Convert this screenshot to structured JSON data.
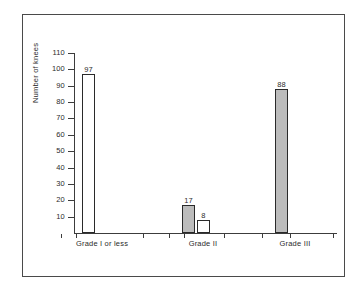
{
  "chart_data": {
    "type": "bar",
    "title": "",
    "subtitle": "",
    "xlabel": "",
    "ylabel": "Number of knees",
    "categories": [
      "Grade I or less",
      "Grade II",
      "Grade III"
    ],
    "ylim": [
      0,
      110
    ],
    "yticks": [
      10,
      20,
      30,
      40,
      50,
      60,
      70,
      80,
      90,
      100,
      110
    ],
    "ytick_labels": [
      "10",
      "20",
      "30",
      "40",
      "50",
      "60",
      "70",
      "80",
      "90",
      "100",
      "110"
    ],
    "grid": false,
    "legend": null,
    "bars": [
      {
        "category": "Grade I or less",
        "value": 97,
        "label": "97",
        "fill": "white",
        "fill_color": "#ffffff",
        "edge_color": "#2a2a2a"
      },
      {
        "category": "Grade II",
        "value": 17,
        "label": "17",
        "fill": "gray",
        "fill_color": "#bcbcbc",
        "edge_color": "#2a2a2a"
      },
      {
        "category": "Grade II",
        "value": 8,
        "label": "8",
        "fill": "white",
        "fill_color": "#ffffff",
        "edge_color": "#2a2a2a"
      },
      {
        "category": "Grade III",
        "value": 88,
        "label": "88",
        "fill": "gray",
        "fill_color": "#bcbcbc",
        "edge_color": "#2a2a2a"
      }
    ]
  },
  "figure": {
    "background_color": "#ffffff",
    "border_color": "#4a4a4a",
    "axis_color": "#3c3c3c",
    "text_color": "#2b2b2b"
  }
}
